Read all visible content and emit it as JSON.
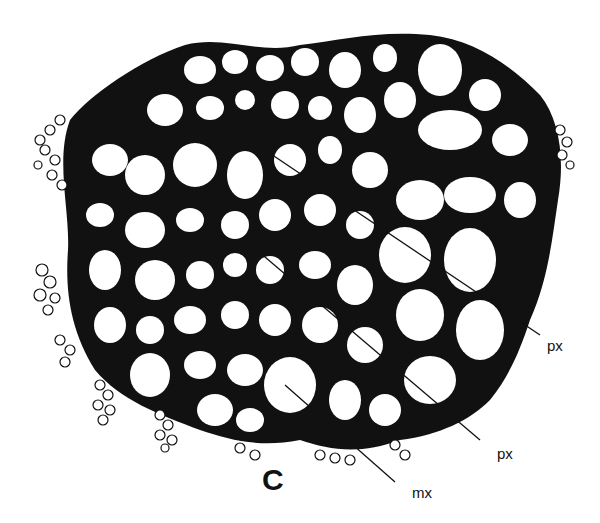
{
  "figure": {
    "panel_label": "C",
    "labels": [
      {
        "id": "px1",
        "text": "px"
      },
      {
        "id": "px2",
        "text": "px"
      },
      {
        "id": "mx",
        "text": "mx"
      }
    ]
  },
  "colors": {
    "ink": "#111111",
    "background": "#ffffff"
  }
}
